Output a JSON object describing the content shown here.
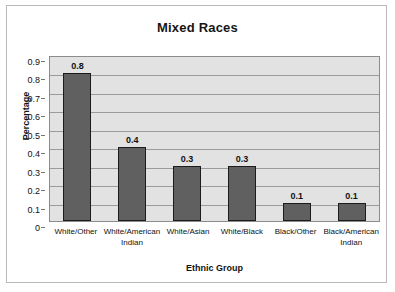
{
  "chart_data": {
    "type": "bar",
    "title": "Mixed Races",
    "xlabel": "Ethnic Group",
    "ylabel": "Percentage",
    "categories": [
      "White/Other",
      "White/American Indian",
      "White/Asian",
      "White/Black",
      "Black/Other",
      "Black/American Indian"
    ],
    "values": [
      0.8,
      0.4,
      0.3,
      0.3,
      0.1,
      0.1
    ],
    "value_labels": [
      "0.8",
      "0.4",
      "0.3",
      "0.3",
      "0.1",
      "0.1"
    ],
    "ylim": [
      0,
      0.9
    ],
    "ytick_labels": [
      "0.9",
      "0.8",
      "0.7",
      "0.6",
      "0.5",
      "0.4",
      "0.3",
      "0.2",
      "0.1",
      "0"
    ],
    "ytick_values": [
      0.9,
      0.8,
      0.7,
      0.6,
      0.5,
      0.4,
      0.3,
      0.2,
      0.1,
      0
    ],
    "grid": true,
    "legend": false,
    "colors": {
      "bar_fill": "#606060",
      "bar_outline": "#1c1c1c",
      "plot_background": "#e2e2e2",
      "gridline": "#9b9b9b",
      "canvas": "#ffffff",
      "frame_border": "#b9b9b9",
      "text": "#121212"
    }
  }
}
